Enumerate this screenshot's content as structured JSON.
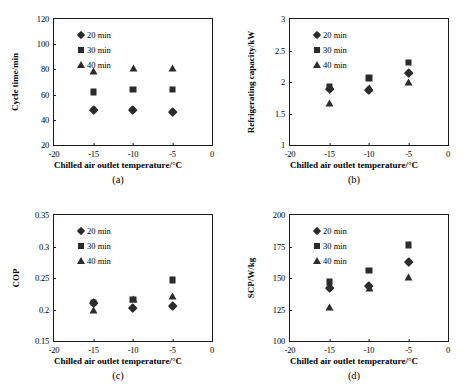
{
  "figure": {
    "xlabel": "Chilled air outlet temperature/°C",
    "legend": [
      {
        "label": "20 min",
        "marker": "diamond-marker-icon"
      },
      {
        "label": "30 min",
        "marker": "square-marker-icon"
      },
      {
        "label": "40 min",
        "marker": "triangle-marker-icon"
      }
    ]
  },
  "chart_data": [
    {
      "type": "scatter",
      "panel": "a",
      "caption": "(a)",
      "title": "",
      "xlabel": "Chilled air outlet temperature/°C",
      "ylabel": "Cycle time/min",
      "x": [
        -15,
        -10,
        -5
      ],
      "xticks": [
        -20,
        -15,
        -10,
        -5,
        0
      ],
      "xlim": [
        -20,
        0
      ],
      "yticks": [
        20,
        40,
        60,
        80,
        100,
        120
      ],
      "ylim": [
        20,
        120
      ],
      "grid": false,
      "legend_position": "upper-left",
      "series": [
        {
          "name": "20 min",
          "marker": "diamond",
          "values": [
            48,
            48,
            46
          ]
        },
        {
          "name": "30 min",
          "marker": "square",
          "values": [
            62,
            64,
            64
          ]
        },
        {
          "name": "40 min",
          "marker": "triangle",
          "values": [
            79,
            81,
            81
          ]
        }
      ]
    },
    {
      "type": "scatter",
      "panel": "b",
      "caption": "(b)",
      "title": "",
      "xlabel": "Chilled air outlet temperature/°C",
      "ylabel": "Refrigerating capacity/kW",
      "x": [
        -15,
        -10,
        -5
      ],
      "xticks": [
        -20,
        -15,
        -10,
        -5,
        0
      ],
      "xlim": [
        -20,
        0
      ],
      "yticks": [
        1,
        1.5,
        2,
        2.5,
        3
      ],
      "ylim": [
        1,
        3
      ],
      "grid": false,
      "legend_position": "upper-left",
      "series": [
        {
          "name": "20 min",
          "marker": "diamond",
          "values": [
            1.89,
            1.88,
            2.15
          ]
        },
        {
          "name": "30 min",
          "marker": "square",
          "values": [
            1.92,
            2.06,
            2.31
          ]
        },
        {
          "name": "40 min",
          "marker": "triangle",
          "values": [
            1.67,
            1.91,
            2.0
          ]
        }
      ]
    },
    {
      "type": "scatter",
      "panel": "c",
      "caption": "(c)",
      "title": "",
      "xlabel": "Chilled air outlet temperature/°C",
      "ylabel": "COP",
      "x": [
        -15,
        -10,
        -5
      ],
      "xticks": [
        -20,
        -15,
        -10,
        -5,
        0
      ],
      "xlim": [
        -20,
        0
      ],
      "yticks": [
        0.15,
        0.2,
        0.25,
        0.3,
        0.35
      ],
      "ylim": [
        0.15,
        0.35
      ],
      "grid": false,
      "legend_position": "upper-left",
      "series": [
        {
          "name": "20 min",
          "marker": "diamond",
          "values": [
            0.21,
            0.203,
            0.206
          ]
        },
        {
          "name": "30 min",
          "marker": "square",
          "values": [
            0.211,
            0.216,
            0.247
          ]
        },
        {
          "name": "40 min",
          "marker": "triangle",
          "values": [
            0.199,
            0.217,
            0.222
          ]
        }
      ]
    },
    {
      "type": "scatter",
      "panel": "d",
      "caption": "(d)",
      "title": "",
      "xlabel": "Chilled air outlet temperature/°C",
      "ylabel": "SCP/W/kg",
      "x": [
        -15,
        -10,
        -5
      ],
      "xticks": [
        -20,
        -15,
        -10,
        -5,
        0
      ],
      "xlim": [
        -20,
        0
      ],
      "yticks": [
        100,
        125,
        150,
        175,
        200
      ],
      "ylim": [
        100,
        200
      ],
      "grid": false,
      "legend_position": "upper-left",
      "series": [
        {
          "name": "20 min",
          "marker": "diamond",
          "values": [
            142,
            143.5,
            163
          ]
        },
        {
          "name": "30 min",
          "marker": "square",
          "values": [
            147,
            156,
            176
          ]
        },
        {
          "name": "40 min",
          "marker": "triangle",
          "values": [
            127,
            142,
            151
          ]
        }
      ]
    }
  ]
}
